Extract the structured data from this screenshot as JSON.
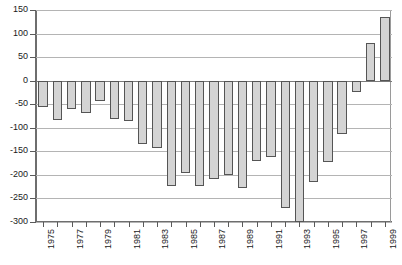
{
  "chart_data": {
    "type": "bar",
    "title": "",
    "subtitle": "",
    "xlabel": "",
    "ylabel": "",
    "ylim": [
      -300,
      150
    ],
    "ytick_values": [
      150,
      100,
      50,
      0,
      -50,
      -100,
      -150,
      -200,
      -250,
      -300
    ],
    "ytick_labels": [
      "150",
      "100",
      "50",
      "0",
      "-50",
      "-100",
      "-150",
      "-200",
      "-250",
      "-300"
    ],
    "grid": true,
    "legend": false,
    "legend_position": "none",
    "bar_fill_color": "#d4d4d4",
    "bar_edge_color": "#555555",
    "grid_color": "#b4b4b4",
    "axis_color": "#6e6e6e",
    "categories": [
      "1975",
      "1976",
      "1977",
      "1978",
      "1979",
      "1980",
      "1981",
      "1982",
      "1983",
      "1984",
      "1985",
      "1986",
      "1987",
      "1988",
      "1989",
      "1990",
      "1991",
      "1992",
      "1993",
      "1994",
      "1995",
      "1996",
      "1997",
      "1998",
      "1999"
    ],
    "xtick_labels_shown": [
      "1975",
      "1977",
      "1979",
      "1981",
      "1983",
      "1985",
      "1987",
      "1989",
      "1991",
      "1993",
      "1995",
      "1997",
      "1999"
    ],
    "values": [
      -55,
      -84,
      -60,
      -68,
      -44,
      -82,
      -86,
      -135,
      -143,
      -223,
      -197,
      -223,
      -208,
      -201,
      -227,
      -170,
      -162,
      -270,
      -300,
      -215,
      -172,
      -113,
      -25,
      80,
      135
    ]
  }
}
